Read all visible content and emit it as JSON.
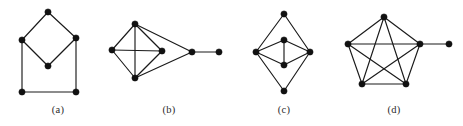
{
  "figure": {
    "type": "graph-diagram-panels",
    "background_color": "#ffffff",
    "vertex_color": "#111111",
    "edge_color": "#1a1a1a",
    "caption_color": "#2b2b2b",
    "width": 463,
    "height": 126,
    "panel_count": 4
  },
  "panels": [
    {
      "id": "a",
      "caption": "(a)",
      "vertex_count": 5,
      "edge_count": 6,
      "description": "diamond over square sharing left and right vertices",
      "vertices": [
        {
          "name": "a-top",
          "x": 48,
          "y": 12
        },
        {
          "name": "a-left",
          "x": 22,
          "y": 40
        },
        {
          "name": "a-right",
          "x": 76,
          "y": 38
        },
        {
          "name": "a-center",
          "x": 48,
          "y": 66
        },
        {
          "name": "a-bottom-left",
          "x": 22,
          "y": 92
        },
        {
          "name": "a-bottom-right",
          "x": 76,
          "y": 92
        }
      ],
      "edges": [
        [
          0,
          1
        ],
        [
          0,
          2
        ],
        [
          1,
          3
        ],
        [
          2,
          3
        ],
        [
          1,
          4
        ],
        [
          2,
          5
        ],
        [
          4,
          5
        ]
      ]
    },
    {
      "id": "b",
      "caption": "(b)",
      "vertex_count": 6,
      "edge_count": 8,
      "description": "diamond with horizontal chord plus two-vertex tail to the right",
      "vertices": [
        {
          "name": "b-left",
          "x": 112,
          "y": 50
        },
        {
          "name": "b-top",
          "x": 135,
          "y": 24
        },
        {
          "name": "b-bottom",
          "x": 135,
          "y": 78
        },
        {
          "name": "b-mid-right",
          "x": 162,
          "y": 51
        },
        {
          "name": "b-joint",
          "x": 192,
          "y": 52
        },
        {
          "name": "b-end",
          "x": 219,
          "y": 52
        }
      ],
      "edges": [
        [
          0,
          1
        ],
        [
          0,
          2
        ],
        [
          0,
          3
        ],
        [
          1,
          2
        ],
        [
          1,
          3
        ],
        [
          2,
          3
        ],
        [
          1,
          4
        ],
        [
          2,
          4
        ],
        [
          4,
          5
        ]
      ]
    },
    {
      "id": "c",
      "caption": "(c)",
      "vertex_count": 6,
      "edge_count": 9,
      "description": "left and right hubs joined to a vertical column of four vertices",
      "vertices": [
        {
          "name": "c-top",
          "x": 284,
          "y": 14
        },
        {
          "name": "c-upper-mid",
          "x": 284,
          "y": 40
        },
        {
          "name": "c-left",
          "x": 256,
          "y": 52
        },
        {
          "name": "c-right",
          "x": 310,
          "y": 52
        },
        {
          "name": "c-lower-mid",
          "x": 284,
          "y": 65
        },
        {
          "name": "c-bottom",
          "x": 284,
          "y": 91
        }
      ],
      "edges": [
        [
          0,
          2
        ],
        [
          0,
          3
        ],
        [
          1,
          2
        ],
        [
          1,
          3
        ],
        [
          1,
          4
        ],
        [
          2,
          4
        ],
        [
          3,
          4
        ],
        [
          2,
          5
        ],
        [
          3,
          5
        ]
      ]
    },
    {
      "id": "d",
      "caption": "(d)",
      "vertex_count": 6,
      "edge_count": 11,
      "description": "complete graph on five vertices with one pendant vertex",
      "vertices": [
        {
          "name": "d-top",
          "x": 384,
          "y": 17
        },
        {
          "name": "d-left",
          "x": 348,
          "y": 44
        },
        {
          "name": "d-right",
          "x": 420,
          "y": 44
        },
        {
          "name": "d-bottom-left",
          "x": 362,
          "y": 84
        },
        {
          "name": "d-bottom-right",
          "x": 406,
          "y": 84
        },
        {
          "name": "d-pendant",
          "x": 449,
          "y": 44
        }
      ],
      "edges": [
        [
          0,
          1
        ],
        [
          0,
          2
        ],
        [
          0,
          3
        ],
        [
          0,
          4
        ],
        [
          1,
          2
        ],
        [
          1,
          3
        ],
        [
          1,
          4
        ],
        [
          2,
          3
        ],
        [
          2,
          4
        ],
        [
          3,
          4
        ],
        [
          2,
          5
        ]
      ]
    }
  ],
  "captions": {
    "a": "(a)",
    "b": "(b)",
    "c": "(c)",
    "d": "(d)"
  },
  "style": {
    "vertex_radius": 3.1,
    "edge_width": 1.15
  }
}
